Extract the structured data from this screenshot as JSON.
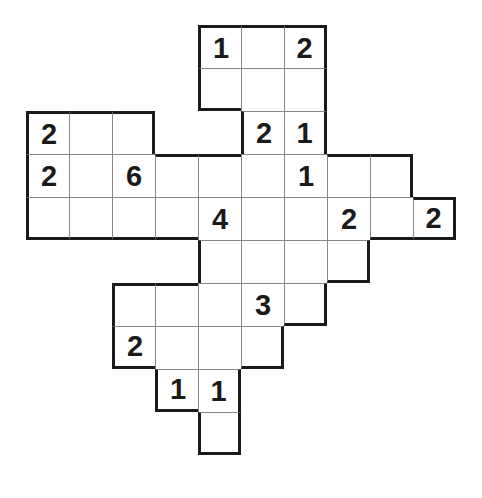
{
  "puzzle": {
    "type": "number-grid-puzzle",
    "cell_size": 43,
    "origin": {
      "x": 26,
      "y": 25
    },
    "colors": {
      "line": "#1a1a1a",
      "thin_line": "#888888",
      "background": "#ffffff",
      "digit": "#1a1a1a"
    },
    "rows": [
      {
        "row": 0,
        "cells": [
          {
            "c": 4,
            "v": "1"
          },
          {
            "c": 5,
            "v": ""
          },
          {
            "c": 6,
            "v": "2"
          }
        ]
      },
      {
        "row": 1,
        "cells": [
          {
            "c": 4,
            "v": ""
          },
          {
            "c": 5,
            "v": ""
          },
          {
            "c": 6,
            "v": ""
          }
        ]
      },
      {
        "row": 2,
        "cells": [
          {
            "c": 0,
            "v": "2"
          },
          {
            "c": 1,
            "v": ""
          },
          {
            "c": 2,
            "v": ""
          },
          {
            "c": 5,
            "v": "2"
          },
          {
            "c": 6,
            "v": "1"
          }
        ]
      },
      {
        "row": 3,
        "cells": [
          {
            "c": 0,
            "v": "2"
          },
          {
            "c": 1,
            "v": ""
          },
          {
            "c": 2,
            "v": "6"
          },
          {
            "c": 3,
            "v": ""
          },
          {
            "c": 4,
            "v": ""
          },
          {
            "c": 5,
            "v": ""
          },
          {
            "c": 6,
            "v": "1"
          },
          {
            "c": 7,
            "v": ""
          },
          {
            "c": 8,
            "v": ""
          }
        ]
      },
      {
        "row": 4,
        "cells": [
          {
            "c": 0,
            "v": ""
          },
          {
            "c": 1,
            "v": ""
          },
          {
            "c": 2,
            "v": ""
          },
          {
            "c": 3,
            "v": ""
          },
          {
            "c": 4,
            "v": "4"
          },
          {
            "c": 5,
            "v": ""
          },
          {
            "c": 6,
            "v": ""
          },
          {
            "c": 7,
            "v": "2"
          },
          {
            "c": 8,
            "v": ""
          },
          {
            "c": 9,
            "v": "2"
          }
        ]
      },
      {
        "row": 5,
        "cells": [
          {
            "c": 4,
            "v": ""
          },
          {
            "c": 5,
            "v": ""
          },
          {
            "c": 6,
            "v": ""
          },
          {
            "c": 7,
            "v": ""
          }
        ]
      },
      {
        "row": 6,
        "cells": [
          {
            "c": 2,
            "v": ""
          },
          {
            "c": 3,
            "v": ""
          },
          {
            "c": 4,
            "v": ""
          },
          {
            "c": 5,
            "v": "3"
          },
          {
            "c": 6,
            "v": ""
          }
        ]
      },
      {
        "row": 7,
        "cells": [
          {
            "c": 2,
            "v": "2"
          },
          {
            "c": 3,
            "v": ""
          },
          {
            "c": 4,
            "v": ""
          },
          {
            "c": 5,
            "v": ""
          }
        ]
      },
      {
        "row": 8,
        "cells": [
          {
            "c": 3,
            "v": "1"
          },
          {
            "c": 4,
            "v": "1"
          }
        ]
      },
      {
        "row": 9,
        "cells": [
          {
            "c": 4,
            "v": ""
          }
        ]
      }
    ]
  }
}
